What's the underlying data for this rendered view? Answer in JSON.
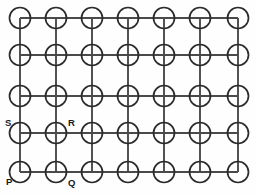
{
  "figure": {
    "kind": "diagram",
    "width": 257,
    "height": 195,
    "background_color": "#fefefe"
  },
  "grid": {
    "columns": 7,
    "rows": 5,
    "column_x": [
      20,
      56,
      92,
      128,
      164,
      200,
      238
    ],
    "row_y": [
      18,
      55,
      96,
      133,
      172
    ],
    "node_radius": 10.5,
    "node_stroke_color": "#2b2b2b",
    "line_color": "#4a4a4a",
    "line_width": 1.9,
    "node_count": 35,
    "horizontal_line_count": 5,
    "vertical_line_count": 7
  },
  "labels": [
    {
      "text": "P",
      "node_col": 0,
      "node_row": 4,
      "x": 6,
      "y": 182,
      "anchor": "start"
    },
    {
      "text": "Q",
      "node_col": 1,
      "node_row": 4,
      "x": 68,
      "y": 183,
      "anchor": "start"
    },
    {
      "text": "R",
      "node_col": 1,
      "node_row": 3,
      "x": 68,
      "y": 123,
      "anchor": "start"
    },
    {
      "text": "S",
      "node_col": 0,
      "node_row": 3,
      "x": 5,
      "y": 123,
      "anchor": "start"
    }
  ]
}
